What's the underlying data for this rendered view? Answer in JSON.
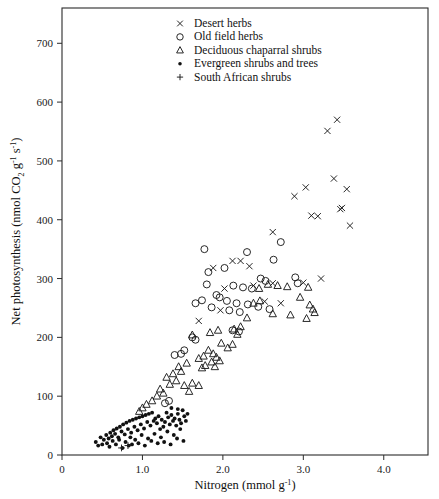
{
  "chart_data": {
    "type": "scatter",
    "title": "",
    "xlabel": "Nitrogen (mmol g-1)",
    "ylabel": "Net photosynthesis (nmol CO2 g-1 s-1)",
    "xlim": [
      0,
      4.55
    ],
    "ylim": [
      0,
      760
    ],
    "xticks": [
      0,
      1.0,
      2.0,
      3.0,
      4.0
    ],
    "xtick_labels": [
      "0",
      "1.0",
      "2.0",
      "3.0",
      "4.0"
    ],
    "yticks": [
      0,
      100,
      200,
      300,
      400,
      500,
      600,
      700
    ],
    "ytick_labels": [
      "0",
      "100",
      "200",
      "300",
      "400",
      "500",
      "600",
      "700"
    ],
    "grid": false,
    "legend_position": "top-center",
    "series": [
      {
        "name": "Desert herbs",
        "marker": "cross-x",
        "points": [
          [
            3.42,
            570
          ],
          [
            3.3,
            551
          ],
          [
            3.03,
            455
          ],
          [
            3.38,
            470
          ],
          [
            2.89,
            440
          ],
          [
            3.1,
            407
          ],
          [
            3.18,
            406
          ],
          [
            3.54,
            452
          ],
          [
            3.48,
            420
          ],
          [
            3.46,
            418
          ],
          [
            3.58,
            390
          ],
          [
            2.62,
            379
          ],
          [
            3.22,
            300
          ],
          [
            3.0,
            293
          ],
          [
            2.62,
            292
          ],
          [
            2.38,
            288
          ],
          [
            2.02,
            283
          ],
          [
            2.12,
            330
          ],
          [
            2.22,
            330
          ],
          [
            2.33,
            321
          ],
          [
            1.97,
            246
          ],
          [
            1.88,
            318
          ],
          [
            2.52,
            261
          ],
          [
            2.72,
            258
          ],
          [
            1.7,
            228
          ]
        ]
      },
      {
        "name": "Old field herbs",
        "marker": "circle-open",
        "points": [
          [
            1.77,
            350
          ],
          [
            2.3,
            345
          ],
          [
            2.72,
            362
          ],
          [
            2.63,
            332
          ],
          [
            2.02,
            318
          ],
          [
            1.82,
            311
          ],
          [
            2.47,
            300
          ],
          [
            2.53,
            296
          ],
          [
            1.8,
            290
          ],
          [
            2.13,
            288
          ],
          [
            2.25,
            285
          ],
          [
            2.36,
            283
          ],
          [
            1.92,
            272
          ],
          [
            1.96,
            268
          ],
          [
            2.05,
            262
          ],
          [
            2.17,
            258
          ],
          [
            2.31,
            256
          ],
          [
            2.44,
            252
          ],
          [
            1.86,
            251
          ],
          [
            2.08,
            246
          ],
          [
            2.21,
            243
          ],
          [
            1.74,
            263
          ],
          [
            1.66,
            258
          ],
          [
            2.58,
            248
          ],
          [
            2.9,
            302
          ],
          [
            2.93,
            292
          ],
          [
            1.62,
            200
          ],
          [
            1.66,
            196
          ],
          [
            1.52,
            178
          ],
          [
            1.48,
            172
          ],
          [
            1.4,
            170
          ],
          [
            2.12,
            212
          ],
          [
            2.2,
            210
          ],
          [
            1.33,
            92
          ],
          [
            1.28,
            88
          ]
        ]
      },
      {
        "name": "Deciduous chaparral shrubs",
        "marker": "triangle-open",
        "points": [
          [
            2.56,
            290
          ],
          [
            2.68,
            288
          ],
          [
            2.8,
            286
          ],
          [
            3.06,
            285
          ],
          [
            2.45,
            283
          ],
          [
            2.96,
            268
          ],
          [
            2.46,
            262
          ],
          [
            2.38,
            258
          ],
          [
            3.08,
            255
          ],
          [
            3.12,
            248
          ],
          [
            3.14,
            242
          ],
          [
            2.62,
            240
          ],
          [
            2.84,
            238
          ],
          [
            3.04,
            232
          ],
          [
            2.3,
            233
          ],
          [
            2.22,
            218
          ],
          [
            2.14,
            214
          ],
          [
            1.94,
            212
          ],
          [
            1.84,
            208
          ],
          [
            2.18,
            205
          ],
          [
            1.98,
            190
          ],
          [
            2.12,
            188
          ],
          [
            2.06,
            182
          ],
          [
            1.82,
            178
          ],
          [
            1.88,
            172
          ],
          [
            1.76,
            168
          ],
          [
            1.92,
            166
          ],
          [
            1.7,
            164
          ],
          [
            1.96,
            160
          ],
          [
            1.86,
            158
          ],
          [
            1.78,
            152
          ],
          [
            1.9,
            150
          ],
          [
            1.74,
            148
          ],
          [
            1.62,
            204
          ],
          [
            1.55,
            156
          ],
          [
            1.45,
            150
          ],
          [
            1.48,
            142
          ],
          [
            1.38,
            138
          ],
          [
            1.3,
            132
          ],
          [
            1.42,
            126
          ],
          [
            1.34,
            120
          ],
          [
            1.52,
            118
          ],
          [
            1.22,
            112
          ],
          [
            1.26,
            105
          ],
          [
            1.18,
            100
          ],
          [
            1.12,
            92
          ],
          [
            1.05,
            86
          ],
          [
            1.0,
            80
          ],
          [
            0.96,
            74
          ],
          [
            1.62,
            122
          ],
          [
            1.7,
            118
          ],
          [
            1.58,
            108
          ]
        ]
      },
      {
        "name": "Evergreen shrubs and trees",
        "marker": "dot-filled",
        "points": [
          [
            0.42,
            22
          ],
          [
            0.48,
            30
          ],
          [
            0.52,
            26
          ],
          [
            0.55,
            34
          ],
          [
            0.58,
            28
          ],
          [
            0.6,
            38
          ],
          [
            0.62,
            32
          ],
          [
            0.64,
            42
          ],
          [
            0.66,
            36
          ],
          [
            0.68,
            45
          ],
          [
            0.7,
            30
          ],
          [
            0.72,
            48
          ],
          [
            0.74,
            40
          ],
          [
            0.76,
            52
          ],
          [
            0.78,
            35
          ],
          [
            0.8,
            55
          ],
          [
            0.82,
            44
          ],
          [
            0.84,
            58
          ],
          [
            0.86,
            38
          ],
          [
            0.88,
            60
          ],
          [
            0.9,
            48
          ],
          [
            0.92,
            62
          ],
          [
            0.94,
            42
          ],
          [
            0.96,
            64
          ],
          [
            0.98,
            52
          ],
          [
            1.0,
            66
          ],
          [
            1.02,
            45
          ],
          [
            1.04,
            68
          ],
          [
            1.06,
            56
          ],
          [
            1.08,
            70
          ],
          [
            1.1,
            50
          ],
          [
            1.12,
            72
          ],
          [
            1.14,
            58
          ],
          [
            1.16,
            62
          ],
          [
            1.18,
            54
          ],
          [
            1.2,
            66
          ],
          [
            1.22,
            44
          ],
          [
            1.24,
            60
          ],
          [
            1.26,
            48
          ],
          [
            1.28,
            56
          ],
          [
            1.3,
            72
          ],
          [
            1.32,
            64
          ],
          [
            1.34,
            52
          ],
          [
            1.36,
            68
          ],
          [
            1.38,
            58
          ],
          [
            1.4,
            62
          ],
          [
            1.42,
            50
          ],
          [
            1.44,
            70
          ],
          [
            1.46,
            60
          ],
          [
            1.48,
            54
          ],
          [
            0.56,
            20
          ],
          [
            0.63,
            24
          ],
          [
            0.71,
            26
          ],
          [
            0.79,
            22
          ],
          [
            0.85,
            30
          ],
          [
            0.91,
            26
          ],
          [
            0.99,
            34
          ],
          [
            1.07,
            28
          ],
          [
            1.15,
            36
          ],
          [
            1.23,
            30
          ],
          [
            1.31,
            40
          ],
          [
            1.39,
            34
          ],
          [
            1.47,
            44
          ],
          [
            0.5,
            18
          ],
          [
            0.67,
            18
          ],
          [
            0.83,
            16
          ],
          [
            0.95,
            20
          ],
          [
            1.11,
            24
          ],
          [
            1.27,
            22
          ],
          [
            1.43,
            28
          ],
          [
            0.45,
            16
          ],
          [
            0.59,
            14
          ],
          [
            0.75,
            12
          ],
          [
            0.87,
            18
          ],
          [
            1.03,
            16
          ],
          [
            1.19,
            20
          ],
          [
            1.35,
            18
          ],
          [
            1.51,
            24
          ],
          [
            1.5,
            76
          ],
          [
            1.52,
            66
          ],
          [
            1.54,
            58
          ],
          [
            1.56,
            70
          ],
          [
            1.44,
            78
          ],
          [
            1.36,
            80
          ]
        ]
      },
      {
        "name": "South African shrubs",
        "marker": "plus",
        "points": [
          [
            0.74,
            12
          ],
          [
            0.82,
            16
          ]
        ]
      }
    ]
  },
  "legend": {
    "items": [
      {
        "marker": "cross-x",
        "label": "Desert herbs"
      },
      {
        "marker": "circle-open",
        "label": "Old field herbs"
      },
      {
        "marker": "triangle-open",
        "label": "Deciduous chaparral shrubs"
      },
      {
        "marker": "dot-filled",
        "label": "Evergreen shrubs and trees"
      },
      {
        "marker": "plus",
        "label": "South African shrubs"
      }
    ]
  },
  "axes": {
    "x_title_main": "Nitrogen (mmol g",
    "x_title_sup": "-1",
    "x_title_tail": ")",
    "y_title_part1": "Net photosynthesis (nmol CO",
    "y_title_sub": "2",
    "y_title_part2": " g",
    "y_title_sup1": "-1",
    "y_title_part3": " s",
    "y_title_sup2": "-1",
    "y_title_tail": ")"
  }
}
